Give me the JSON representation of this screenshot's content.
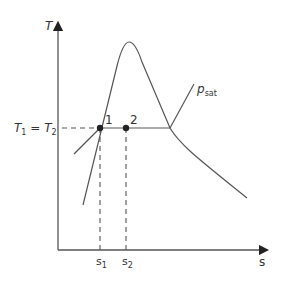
{
  "diagram": {
    "type": "T-s diagram",
    "y_axis_label": "T",
    "x_axis_label": "s",
    "temperature_label": "T",
    "temperature_sub1": "1",
    "temperature_eq": " = ",
    "temperature_sub2": "2",
    "point1_label": "1",
    "point2_label": "2",
    "s1_label": "s",
    "s1_sub": "1",
    "s2_label": "s",
    "s2_sub": "2",
    "isobar_label": "p",
    "isobar_sub": "sat",
    "line_color": "#555555",
    "dash_color": "#555555"
  }
}
